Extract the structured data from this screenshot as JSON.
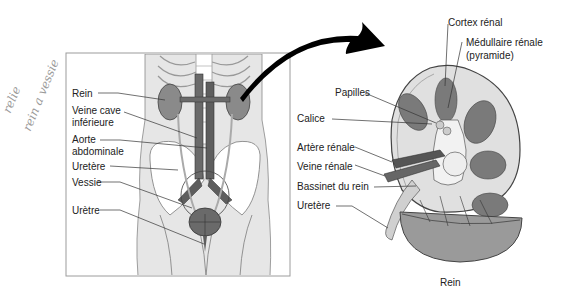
{
  "annotation": {
    "handwritten_line1": "relie",
    "handwritten_line2": "rein a vessie"
  },
  "body_diagram": {
    "labels": [
      {
        "id": "rein",
        "text": "Rein"
      },
      {
        "id": "veine-cave-1",
        "text": "Veine cave"
      },
      {
        "id": "veine-cave-2",
        "text": "inférieure"
      },
      {
        "id": "aorte-1",
        "text": "Aorte"
      },
      {
        "id": "aorte-2",
        "text": "abdominale"
      },
      {
        "id": "uretere",
        "text": "Uretère"
      },
      {
        "id": "vessie",
        "text": "Vessie"
      },
      {
        "id": "uretre",
        "text": "Urètre"
      }
    ]
  },
  "kidney_diagram": {
    "labels": [
      {
        "id": "cortex",
        "text": "Cortex rénal"
      },
      {
        "id": "medullaire-1",
        "text": "Médullaire rénale"
      },
      {
        "id": "medullaire-2",
        "text": "(pyramide)"
      },
      {
        "id": "papilles",
        "text": "Papilles"
      },
      {
        "id": "calice",
        "text": "Calice"
      },
      {
        "id": "artere",
        "text": "Artère rénale"
      },
      {
        "id": "veine",
        "text": "Veine rénale"
      },
      {
        "id": "bassinet",
        "text": "Bassinet du rein"
      },
      {
        "id": "uretere",
        "text": "Uretère"
      }
    ],
    "caption": "Rein"
  },
  "colors": {
    "organ": "#8a8a8a",
    "organ_dark": "#5e5e5e",
    "bone": "#ffffff",
    "tissue": "#e6e6e6",
    "line": "#333333",
    "frame": "#9c9c9c",
    "arrow": "#000000"
  }
}
